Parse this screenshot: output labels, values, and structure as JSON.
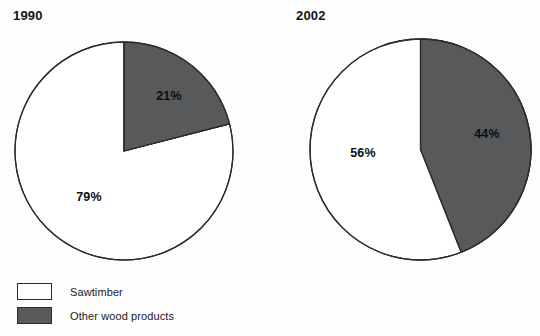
{
  "colors": {
    "sawtimber": "#ffffff",
    "other_wood_products": "#57595a",
    "outline": "#2b2b2b",
    "text": "#111111",
    "background": "#fdfdfd"
  },
  "legend": {
    "items": [
      {
        "label": "Sawtimber",
        "swatch": "white"
      },
      {
        "label": "Other wood products",
        "swatch": "gray"
      }
    ]
  },
  "charts": [
    {
      "title": "1990",
      "labels": {
        "other": "21%",
        "sawtimber": "79%"
      }
    },
    {
      "title": "2002",
      "labels": {
        "other": "44%",
        "sawtimber": "56%"
      }
    }
  ],
  "chart_data": [
    {
      "type": "pie",
      "title": "1990",
      "categories": [
        "Other wood products",
        "Sawtimber"
      ],
      "values": [
        21,
        79
      ],
      "data_labels": [
        "21%",
        "79%"
      ],
      "colors": [
        "#57595a",
        "#ffffff"
      ],
      "start_angle_deg": 0,
      "direction": "clockwise",
      "units": "percent",
      "legend": [
        "Sawtimber",
        "Other wood products"
      ],
      "legend_position": "bottom-left"
    },
    {
      "type": "pie",
      "title": "2002",
      "categories": [
        "Other wood products",
        "Sawtimber"
      ],
      "values": [
        44,
        56
      ],
      "data_labels": [
        "44%",
        "56%"
      ],
      "colors": [
        "#57595a",
        "#ffffff"
      ],
      "start_angle_deg": 0,
      "direction": "clockwise",
      "units": "percent",
      "legend": [
        "Sawtimber",
        "Other wood products"
      ],
      "legend_position": "bottom-left"
    }
  ]
}
